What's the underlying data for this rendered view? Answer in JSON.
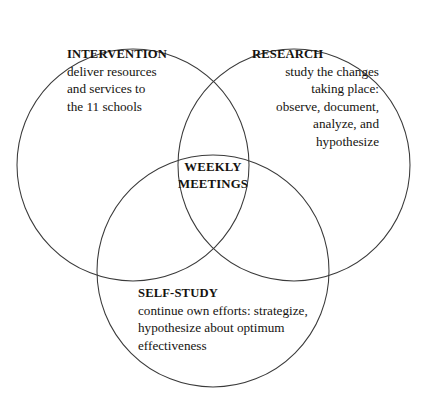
{
  "diagram": {
    "type": "venn",
    "set_count": 3,
    "background_color": "#ffffff",
    "stroke_color": "#3a3a3a",
    "circles": [
      {
        "id": "intervention",
        "cx": 133,
        "cy": 165,
        "r": 116
      },
      {
        "id": "research",
        "cx": 294,
        "cy": 165,
        "r": 116
      },
      {
        "id": "self-study",
        "cx": 213,
        "cy": 271,
        "r": 116
      }
    ]
  },
  "sets": {
    "intervention": {
      "title": "INTERVENTION",
      "lines": [
        "deliver resources",
        "and services to",
        "the 11 schools"
      ]
    },
    "research": {
      "title": "RESEARCH",
      "lines": [
        "study the changes",
        "taking place:",
        "observe, document,",
        "analyze, and",
        "hypothesize"
      ]
    },
    "self_study": {
      "title": "SELF-STUDY",
      "lines": [
        "continue own efforts: strategize,",
        "hypothesize about optimum",
        "effectiveness"
      ]
    }
  },
  "intersection": {
    "center": {
      "line1": "WEEKLY",
      "line2": "MEETINGS"
    }
  }
}
